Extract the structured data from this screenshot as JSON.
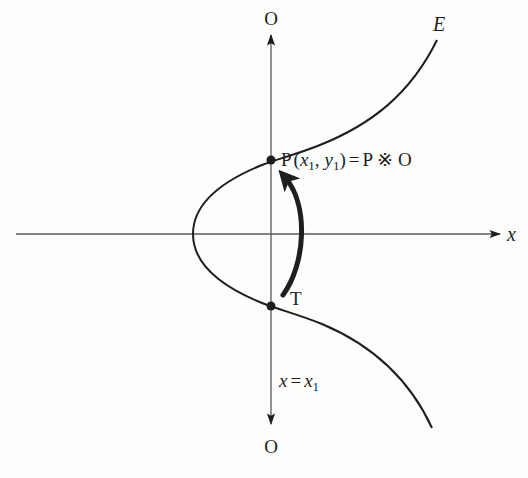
{
  "diagram": {
    "type": "elliptic-curve-group-law",
    "curve_label": "E",
    "x_axis_label": "x",
    "top_point_label": "O",
    "bottom_point_label": "O",
    "vertical_line_label": {
      "lhs": "x",
      "eq": "=",
      "rhs": "x",
      "rhs_sub": "1"
    },
    "point_P_label": {
      "name": "P",
      "open": "(",
      "x": "x",
      "x_sub": "1",
      "comma": ",",
      "y": "y",
      "y_sub": "1",
      "close": ")",
      "eq": "=",
      "rhs": "P ※ O"
    },
    "point_T_label": "T",
    "colors": {
      "ink": "#1e1e1e",
      "axis": "#5a5a5a",
      "background": "#fdfdfb"
    }
  }
}
